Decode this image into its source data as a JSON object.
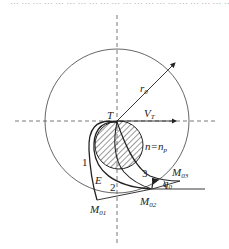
{
  "figure": {
    "top_text_fragment": "… … … … … … … … … … … … … … … … … … … … … … … … …₀",
    "labels": {
      "radius": "r",
      "radius_sub": "0",
      "target_point": "T",
      "velocity": "V",
      "velocity_sub": "T",
      "navigation_ratio": "n=n",
      "navigation_ratio_sub": "p",
      "curve_1": "1",
      "curve_2": "2",
      "curve_3": "3",
      "point_E": "E",
      "point_M01": "M",
      "point_M01_sub": "01",
      "point_M02": "M",
      "point_M02_sub": "02",
      "point_M03": "M",
      "point_M03_sub": "03",
      "angle": "q",
      "angle_sub": "0"
    },
    "colors": {
      "stroke": "#222222",
      "thin_stroke": "#555555",
      "hatch": "#333333",
      "background": "#ffffff"
    }
  }
}
